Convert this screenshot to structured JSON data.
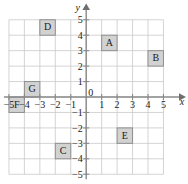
{
  "figure": {
    "type": "coordinate-grid",
    "axis_labels": {
      "x": "x",
      "y": "y"
    },
    "origin_label": "0",
    "x_range": [
      -5,
      5
    ],
    "y_range": [
      -5,
      5
    ],
    "grid": true,
    "x_ticks": [
      "−5",
      "−4",
      "−3",
      "−2",
      "−1",
      "1",
      "2",
      "3",
      "4",
      "5"
    ],
    "x_tick_values": [
      -5,
      -4,
      -3,
      -2,
      -1,
      1,
      2,
      3,
      4,
      5
    ],
    "y_ticks": [
      "5",
      "4",
      "3",
      "2",
      "1",
      "−1",
      "−2",
      "−3",
      "−4",
      "−5"
    ],
    "y_tick_values": [
      5,
      4,
      3,
      2,
      1,
      -1,
      -2,
      -3,
      -4,
      -5
    ],
    "colors": {
      "box_fill": "#d2d2d2",
      "box_stroke": "#8f8f8f",
      "grid": "#c9c9c9",
      "axis": "#8a8a8a",
      "text": "#1a1a1a"
    },
    "boxes": [
      {
        "label": "A",
        "x0": 1,
        "y0": 3,
        "x1": 2,
        "y1": 4
      },
      {
        "label": "B",
        "x0": 4,
        "y0": 2,
        "x1": 5,
        "y1": 3
      },
      {
        "label": "C",
        "x0": -2,
        "y0": -4,
        "x1": -1,
        "y1": -3
      },
      {
        "label": "D",
        "x0": -3,
        "y0": 4,
        "x1": -2,
        "y1": 5
      },
      {
        "label": "E",
        "x0": 2,
        "y0": -3,
        "x1": 3,
        "y1": -2
      },
      {
        "label": "F",
        "x0": -5,
        "y0": -1,
        "x1": -4,
        "y1": 0
      },
      {
        "label": "G",
        "x0": -4,
        "y0": 0,
        "x1": -3,
        "y1": 1
      }
    ]
  }
}
